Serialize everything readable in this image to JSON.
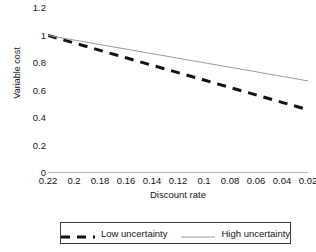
{
  "chart_data": {
    "type": "line",
    "title": "",
    "xlabel": "Discount rate",
    "ylabel": "Variable cost",
    "x": [
      0.22,
      0.2,
      0.18,
      0.16,
      0.14,
      0.12,
      0.1,
      0.08,
      0.06,
      0.04,
      0.02
    ],
    "xtick_labels": [
      "0.22",
      "0.2",
      "0.18",
      "0.16",
      "0.14",
      "0.12",
      "0.1",
      "0.08",
      "0.06",
      "0.04",
      "0.02"
    ],
    "ytick_labels": [
      "1.2",
      "1",
      "0.8",
      "0.6",
      "0.4",
      "0.2",
      "0"
    ],
    "ytick_values": [
      1.2,
      1,
      0.8,
      0.6,
      0.4,
      0.2,
      0
    ],
    "ylim": [
      0,
      1.2
    ],
    "xlim_order": "descending",
    "grid": false,
    "legend_position": "bottom",
    "series": [
      {
        "name": "Low uncertainty",
        "style": "dashed",
        "color": "#111111",
        "width": 3,
        "values": [
          1.0,
          0.946,
          0.892,
          0.838,
          0.784,
          0.73,
          0.676,
          0.622,
          0.568,
          0.514,
          0.46
        ]
      },
      {
        "name": "High uncertainty",
        "style": "solid",
        "color": "#9a9a9a",
        "width": 1,
        "values": [
          1.0,
          0.967,
          0.934,
          0.901,
          0.868,
          0.835,
          0.802,
          0.769,
          0.736,
          0.703,
          0.67
        ]
      }
    ]
  },
  "axes": {
    "x_title": "Discount rate",
    "y_title": "Variable cost",
    "axis_line_color": "#6b6b6b"
  },
  "legend": {
    "entries": [
      {
        "label": "Low uncertainty",
        "swatch": "dashed-line-swatch"
      },
      {
        "label": "High uncertainty",
        "swatch": "solid-line-swatch"
      }
    ]
  }
}
